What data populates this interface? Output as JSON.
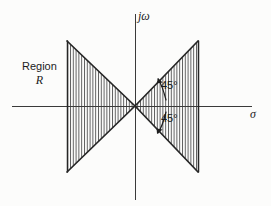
{
  "figure": {
    "background_color": "#fcfcfb",
    "ink_color": "#2b2b2b",
    "hatch_color": "#4a4a4a"
  },
  "axes": {
    "vertical": {
      "label": "jω",
      "name": "imaginary-axis",
      "x": 135,
      "y_top": 14,
      "y_bottom": 200
    },
    "horizontal": {
      "label": "σ",
      "name": "real-axis",
      "y": 106,
      "x_left": 12,
      "x_right": 252
    },
    "origin": {
      "x": 135,
      "y": 106
    }
  },
  "region": {
    "name": "Region R",
    "label_line1": "Region",
    "label_line2": "R",
    "description": "bow-tie shaped hatched region formed by two 45-degree cones meeting at the origin",
    "fill": "vertical-hatching"
  },
  "annotations": {
    "angle_upper": "45°",
    "angle_lower": "45°"
  },
  "geometry": {
    "apex": {
      "x": 135,
      "y": 106
    },
    "left_cone": {
      "back_edge_x": 67,
      "top_y": 41,
      "bottom_y": 172
    },
    "right_cone": {
      "back_edge_x": 198,
      "top_y": 41,
      "bottom_y": 172
    },
    "hatch_spacing_px": 2.8
  }
}
